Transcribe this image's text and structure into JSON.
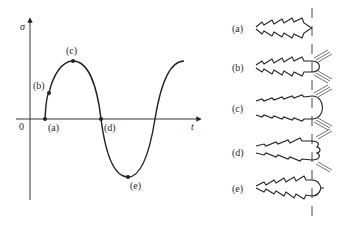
{
  "diagram": {
    "left_graph": {
      "y_axis_label": "σ",
      "x_axis_label": "t",
      "origin_label": "0",
      "curve": "sinusoidal stress vs time, starting at zero and rising",
      "points": [
        {
          "id": "a",
          "label": "(a)",
          "phase": "zero stress, start of loading"
        },
        {
          "id": "b",
          "label": "(b)",
          "phase": "rising tensile stress"
        },
        {
          "id": "c",
          "label": "(c)",
          "phase": "maximum tensile stress"
        },
        {
          "id": "d",
          "label": "(d)",
          "phase": "zero stress, unloading"
        },
        {
          "id": "e",
          "label": "(e)",
          "phase": "maximum compressive stress"
        }
      ]
    },
    "right_panel": {
      "description": "crack tip geometry at each stage",
      "stages": [
        {
          "id": "a",
          "label": "(a)",
          "tip": "sharp crack, closed"
        },
        {
          "id": "b",
          "label": "(b)",
          "tip": "tip opening with slip bands"
        },
        {
          "id": "c",
          "label": "(c)",
          "tip": "fully blunted rounded tip"
        },
        {
          "id": "d",
          "label": "(d)",
          "tip": "tip folding, crack closing"
        },
        {
          "id": "e",
          "label": "(e)",
          "tip": "re-sharpened crack, advanced"
        }
      ]
    }
  }
}
